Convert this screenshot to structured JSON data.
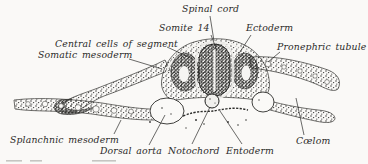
{
  "figure": {
    "kind": "anatomical-engraving",
    "colors": {
      "background": "#faf9f7",
      "ink": "#222220",
      "label_text": "#2a2a28",
      "faint_fragment": "#c6c5c2"
    }
  },
  "labels": {
    "spinal_cord": "Spinal cord",
    "somite_14": "Somite 14",
    "ectoderm": "Ectoderm",
    "central_cells_of_segment": "Central cells of segment",
    "somatic_mesoderm": "Somatic mesoderm",
    "pronephric_tubule": "Pronephric tubule",
    "splanchnic_mesoderm": "Splanchnic mesoderm",
    "dorsal_aorta": "Dorsal aorta",
    "notochord": "Notochord",
    "entoderm": "Entoderm",
    "coelom": "Cœlom"
  }
}
